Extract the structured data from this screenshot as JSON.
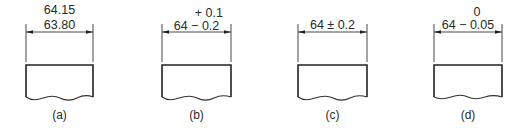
{
  "figure": {
    "panels": [
      {
        "id": "a",
        "caption": "(a)",
        "tolerance_type": "limit-dimensions",
        "upper_text": "64.15",
        "lower_text": "63.80",
        "x_left": 26,
        "x_right": 93
      },
      {
        "id": "b",
        "caption": "(b)",
        "tolerance_type": "unilateral-bilateral-deviation",
        "upper_text": "+ 0.1",
        "lower_text": "64 − 0.2",
        "x_left": 162,
        "x_right": 231
      },
      {
        "id": "c",
        "caption": "(c)",
        "tolerance_type": "equal-bilateral",
        "upper_text": "",
        "lower_text": "64 ± 0.2",
        "x_left": 298,
        "x_right": 367
      },
      {
        "id": "d",
        "caption": "(d)",
        "tolerance_type": "unilateral",
        "upper_text": "0",
        "lower_text": "64 − 0.05",
        "x_left": 434,
        "x_right": 502
      }
    ]
  }
}
